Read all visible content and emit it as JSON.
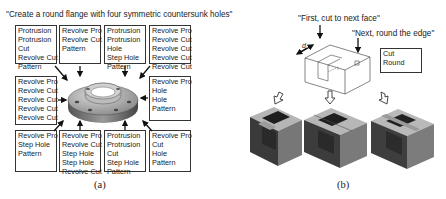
{
  "panel_a": {
    "caption": "\"Create a round flange with four symmetric countersunk holes\"",
    "label": "(a)",
    "center_object": "flange-3d-model",
    "boxes": [
      {
        "position": "top-1",
        "lines": [
          "Protrusion",
          "Protrusion",
          "Cut",
          "Revolve Cut",
          "Pattern"
        ]
      },
      {
        "position": "top-2",
        "lines": [
          "Revolve Pro",
          "Revolve Cut",
          "Pattern"
        ]
      },
      {
        "position": "top-3",
        "lines": [
          "Protrusion",
          "Protrusion",
          "Hole",
          "Step Hole",
          "Pattern"
        ]
      },
      {
        "position": "top-4",
        "lines": [
          "Revolve Pro",
          "Revolve Cut",
          "Revolve Cut",
          "Revolve Cut",
          "Revolve Cut"
        ]
      },
      {
        "position": "mid-left",
        "lines": [
          "Revolve Pro",
          "Revolve Cut",
          "Revolve Cut",
          "Revolve Cut",
          "Revolve Cut"
        ]
      },
      {
        "position": "mid-right",
        "lines": [
          "Revolve Pro",
          "Hole",
          "Hole",
          "Pattern"
        ]
      },
      {
        "position": "bottom-1",
        "lines": [
          "Revolve Pro",
          "Step Hole",
          "Pattern"
        ]
      },
      {
        "position": "bottom-2",
        "lines": [
          "Revolve Pro",
          "Revolve Cut",
          "Step Hole",
          "Step Hole",
          "Revolve Cut"
        ]
      },
      {
        "position": "bottom-3",
        "lines": [
          "Protrusion",
          "Protrusion",
          "Cut",
          "Step Hole",
          "Pattern"
        ]
      },
      {
        "position": "bottom-4",
        "lines": [
          "Revolve Pro",
          "Cut",
          "Hole",
          "Pattern"
        ]
      }
    ]
  },
  "panel_b": {
    "caption_first": "\"First, cut to next face\"",
    "caption_next": "\"Next, round the edge\"",
    "dimension_label": "d",
    "label": "(b)",
    "box": {
      "lines": [
        "Cut",
        "Round"
      ]
    },
    "results": [
      "variant-1",
      "variant-2",
      "variant-3"
    ]
  }
}
